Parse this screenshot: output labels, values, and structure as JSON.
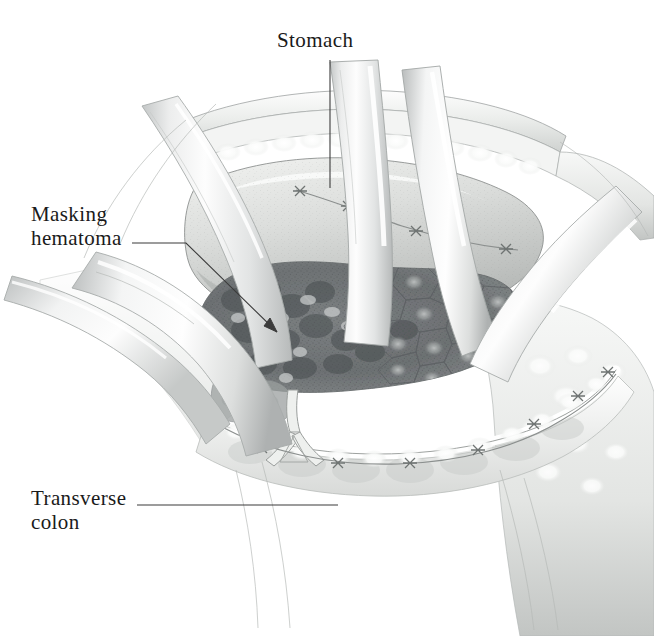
{
  "figure": {
    "kind": "surgical-illustration",
    "background_color": "#ffffff",
    "ink_color": "#1a1a1a",
    "width": 654,
    "height": 636
  },
  "labels": [
    {
      "id": "stomach",
      "text": "Stomach",
      "leader": "vertical-line-down"
    },
    {
      "id": "masking-hematoma",
      "text": "Masking\nhematoma",
      "leader": "elbow-line-with-arrowhead"
    },
    {
      "id": "transverse-colon",
      "text": "Transverse\ncolon",
      "leader": "horizontal-line-right"
    }
  ],
  "label_text": {
    "stomach": "Stomach",
    "masking_hematoma": "Masking\nhematoma",
    "transverse_colon": "Transverse\ncolon"
  },
  "anatomy": {
    "stomach_label": "Stomach",
    "hematoma_label": "Masking hematoma",
    "colon_label": "Transverse colon",
    "retractors": "surgical retractor blades",
    "sutures": "suture chain with knots",
    "abdominal_wall": "abdominal wall with subcutaneous fat",
    "omentum": "greater omentum lobules"
  },
  "palette": {
    "paper": "#ffffff",
    "ink": "#1a1a1a",
    "line_gray": "#6d7275",
    "tissue_light": "#f2f2f0",
    "tissue_mid": "#d7d8d6",
    "tissue_dark": "#9fa2a0",
    "hematoma_dark": "#6f7375",
    "hematoma_mottle": "#565b5e",
    "retractor_light": "#fbfbfb",
    "retractor_shade": "#c9cbcb",
    "fat_globule": "#fdfdfd"
  }
}
